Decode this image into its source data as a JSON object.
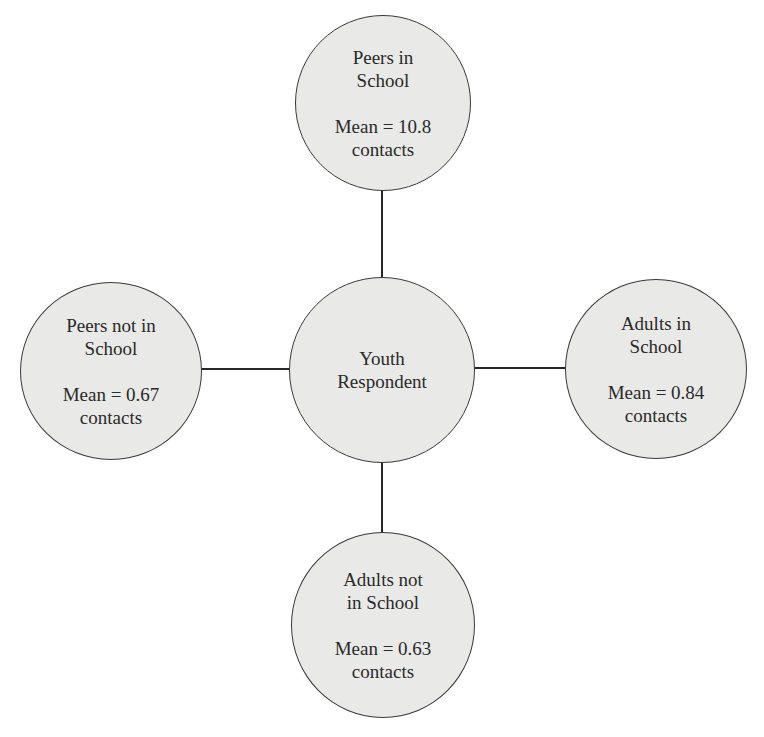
{
  "diagram": {
    "type": "ego-network",
    "center": {
      "label_lines": [
        "Youth",
        "Respondent"
      ]
    },
    "nodes": {
      "top": {
        "label_lines": [
          "Peers in",
          "School"
        ],
        "stat_lines": [
          "Mean = 10.8",
          "contacts"
        ],
        "mean": 10.8
      },
      "left": {
        "label_lines": [
          "Peers not in",
          "School"
        ],
        "stat_lines": [
          "Mean = 0.67",
          "contacts"
        ],
        "mean": 0.67
      },
      "right": {
        "label_lines": [
          "Adults in",
          "School"
        ],
        "stat_lines": [
          "Mean = 0.84",
          "contacts"
        ],
        "mean": 0.84
      },
      "bottom": {
        "label_lines": [
          "Adults not",
          "in School"
        ],
        "stat_lines": [
          "Mean = 0.63",
          "contacts"
        ],
        "mean": 0.63
      }
    },
    "edges": [
      {
        "from": "Youth Respondent",
        "to": "Peers in School"
      },
      {
        "from": "Youth Respondent",
        "to": "Peers not in School"
      },
      {
        "from": "Youth Respondent",
        "to": "Adults in School"
      },
      {
        "from": "Youth Respondent",
        "to": "Adults not in School"
      }
    ],
    "colors": {
      "node_fill": "#e9e9e7",
      "node_stroke": "#3a3838",
      "edge": "#2a2626",
      "text": "#2a2a2a",
      "background": "#ffffff"
    }
  }
}
